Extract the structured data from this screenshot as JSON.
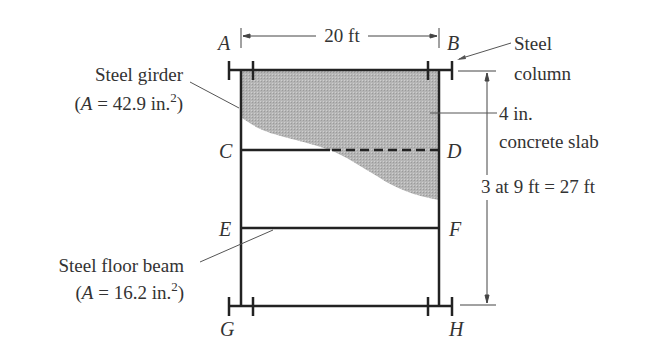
{
  "figure": {
    "points": {
      "A": "A",
      "B": "B",
      "C": "C",
      "D": "D",
      "E": "E",
      "F": "F",
      "G": "G",
      "H": "H"
    },
    "dimensions": {
      "width": "20 ft",
      "height": "3 at 9 ft = 27 ft"
    },
    "labels": {
      "girder_line1": "Steel girder",
      "girder_line2_prefix": "(",
      "girder_A": "A",
      "girder_line2_value": " = 42.9 in.",
      "girder_sup": "2",
      "girder_close": ")",
      "column_line1": "Steel",
      "column_line2": "column",
      "slab_line1": "4 in.",
      "slab_line2": "concrete slab",
      "beam_line1": "Steel floor beam",
      "beam_line2_prefix": "(",
      "beam_A": "A",
      "beam_line2_value": " = 16.2 in.",
      "beam_sup": "2",
      "beam_close": ")"
    },
    "colors": {
      "line": "#222222",
      "slab_fill": "#b8b8b8",
      "text": "#333333"
    }
  }
}
